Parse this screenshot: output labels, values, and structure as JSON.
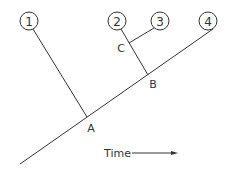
{
  "diagram": {
    "type": "phylogenetic-tree",
    "leaves": [
      {
        "id": "1",
        "label": "1"
      },
      {
        "id": "2",
        "label": "2"
      },
      {
        "id": "3",
        "label": "3"
      },
      {
        "id": "4",
        "label": "4"
      }
    ],
    "nodes": [
      {
        "id": "A",
        "label": "A"
      },
      {
        "id": "B",
        "label": "B"
      },
      {
        "id": "C",
        "label": "C"
      }
    ],
    "axis": {
      "label": "Time",
      "arrow": "right-arrow"
    },
    "colors": {
      "line": "#333333",
      "background": "#ffffff"
    }
  }
}
